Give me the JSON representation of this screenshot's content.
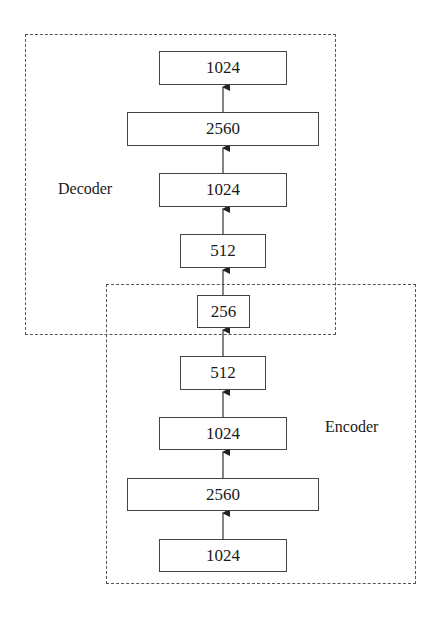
{
  "diagram": {
    "groups": [
      {
        "name": "decoder",
        "label": "Decoder"
      },
      {
        "name": "encoder",
        "label": "Encoder"
      }
    ],
    "decoder_layers": [
      "1024",
      "2560",
      "1024",
      "512"
    ],
    "bottleneck": "256",
    "encoder_layers": [
      "512",
      "1024",
      "2560",
      "1024"
    ],
    "flow_direction": "bottom-to-top",
    "colors": {
      "line": "#444444",
      "dashed_border": "#555555",
      "text": "#1a1a1a",
      "background": "#ffffff"
    }
  }
}
